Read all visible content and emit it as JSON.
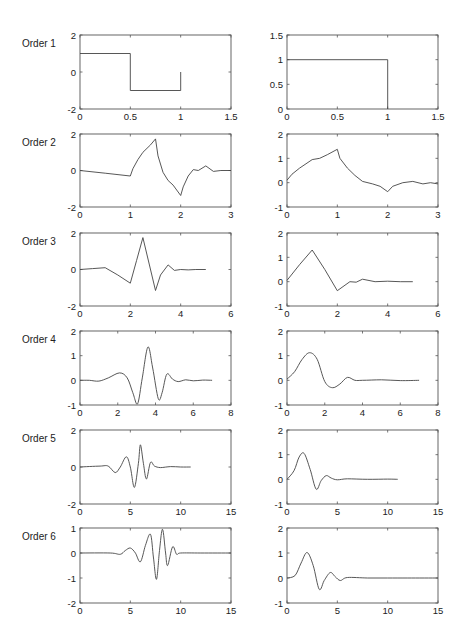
{
  "figure": {
    "width": 465,
    "height": 643,
    "layout": {
      "col_x": [
        [
          80,
          231
        ],
        [
          287,
          438
        ]
      ],
      "row_y": [
        [
          35,
          109
        ],
        [
          134,
          207
        ],
        [
          233,
          306
        ],
        [
          331,
          405
        ],
        [
          430,
          504
        ],
        [
          528,
          603
        ]
      ],
      "row_label_x": 22
    }
  },
  "chart_data": {
    "type": "line",
    "title": "",
    "grid": false,
    "rows": [
      {
        "label": "Order 1",
        "left": {
          "xlim": [
            0,
            1.5
          ],
          "ylim": [
            -2,
            2
          ],
          "xticks": [
            0,
            0.5,
            1,
            1.5
          ],
          "xtick_labels": [
            "0",
            "0.5",
            "1",
            "1.5"
          ],
          "yticks": [
            -2,
            0,
            2
          ],
          "ytick_labels": [
            "-2",
            "0",
            "2"
          ],
          "x": [
            0,
            0.5,
            0.5,
            1,
            1
          ],
          "y": [
            1,
            1,
            -1,
            -1,
            0
          ]
        },
        "right": {
          "xlim": [
            0,
            1.5
          ],
          "ylim": [
            0,
            1.5
          ],
          "xticks": [
            0,
            0.5,
            1,
            1.5
          ],
          "xtick_labels": [
            "0",
            "0.5",
            "1",
            "1.5"
          ],
          "yticks": [
            0,
            0.5,
            1,
            1.5
          ],
          "ytick_labels": [
            "0",
            "0.5",
            "1",
            "1.5"
          ],
          "x": [
            0,
            1,
            1
          ],
          "y": [
            1,
            1,
            0
          ]
        }
      },
      {
        "label": "Order 2",
        "left": {
          "xlim": [
            0,
            3
          ],
          "ylim": [
            -2,
            2
          ],
          "xticks": [
            0,
            1,
            2,
            3
          ],
          "xtick_labels": [
            "0",
            "1",
            "2",
            "3"
          ],
          "yticks": [
            -2,
            0,
            2
          ],
          "ytick_labels": [
            "-2",
            "0",
            "2"
          ],
          "x": [
            0,
            0.5,
            1,
            1.05,
            1.15,
            1.25,
            1.4,
            1.5,
            1.55,
            1.65,
            1.75,
            1.85,
            2,
            2.05,
            2.15,
            2.25,
            2.35,
            2.5,
            2.65,
            2.8,
            3
          ],
          "y": [
            0,
            -0.15,
            -0.3,
            0.1,
            0.6,
            1.0,
            1.4,
            1.73,
            0.8,
            -0.1,
            -0.55,
            -0.8,
            -1.37,
            -0.9,
            -0.3,
            0.05,
            0.0,
            0.25,
            -0.05,
            0.0,
            0.0
          ]
        },
        "right": {
          "xlim": [
            0,
            3
          ],
          "ylim": [
            -1,
            2
          ],
          "xticks": [
            0,
            1,
            2,
            3
          ],
          "xtick_labels": [
            "0",
            "1",
            "2",
            "3"
          ],
          "yticks": [
            -1,
            0,
            1,
            2
          ],
          "ytick_labels": [
            "-1",
            "0",
            "1",
            "2"
          ],
          "x": [
            0,
            0.1,
            0.25,
            0.5,
            0.65,
            0.8,
            1,
            1.05,
            1.2,
            1.35,
            1.5,
            1.7,
            1.85,
            2,
            2.1,
            2.3,
            2.5,
            2.7,
            2.85,
            3
          ],
          "y": [
            0.1,
            0.35,
            0.6,
            0.95,
            1.0,
            1.15,
            1.37,
            1.0,
            0.6,
            0.3,
            0.05,
            -0.05,
            -0.15,
            -0.37,
            -0.15,
            0.0,
            0.05,
            -0.05,
            0.0,
            -0.05
          ]
        }
      },
      {
        "label": "Order 3",
        "left": {
          "xlim": [
            0,
            6
          ],
          "ylim": [
            -2,
            2
          ],
          "xticks": [
            0,
            2,
            4,
            6
          ],
          "xtick_labels": [
            "0",
            "2",
            "4",
            "6"
          ],
          "yticks": [
            -2,
            0,
            2
          ],
          "ytick_labels": [
            "-2",
            "0",
            "2"
          ],
          "x": [
            0,
            0.5,
            1,
            1.5,
            2,
            2.25,
            2.5,
            2.75,
            3,
            3.2,
            3.5,
            3.75,
            4,
            4.3,
            4.6,
            5
          ],
          "y": [
            0,
            0.05,
            0.1,
            -0.3,
            -0.75,
            0.5,
            1.75,
            0.3,
            -1.15,
            -0.3,
            0.25,
            -0.05,
            0.0,
            -0.02,
            0.0,
            0.0
          ]
        },
        "right": {
          "xlim": [
            0,
            6
          ],
          "ylim": [
            -1,
            2
          ],
          "xticks": [
            0,
            2,
            4,
            6
          ],
          "xtick_labels": [
            "0",
            "2",
            "4",
            "6"
          ],
          "yticks": [
            -1,
            0,
            1,
            2
          ],
          "ytick_labels": [
            "-1",
            "0",
            "1",
            "2"
          ],
          "x": [
            0,
            0.5,
            1,
            1.5,
            2,
            2.5,
            2.75,
            3,
            3.5,
            4,
            4.5,
            5
          ],
          "y": [
            0.05,
            0.7,
            1.3,
            0.5,
            -0.37,
            0.0,
            -0.02,
            0.1,
            0.0,
            0.02,
            0.0,
            0.0
          ]
        }
      },
      {
        "label": "Order 4",
        "left": {
          "xlim": [
            0,
            8
          ],
          "ylim": [
            -1,
            2
          ],
          "xticks": [
            0,
            2,
            4,
            6,
            8
          ],
          "xtick_labels": [
            "0",
            "2",
            "4",
            "6",
            "8"
          ],
          "yticks": [
            -1,
            0,
            1,
            2
          ],
          "ytick_labels": [
            "-1",
            "0",
            "1",
            "2"
          ],
          "x": [
            0,
            0.5,
            1,
            1.5,
            2.1,
            2.5,
            2.8,
            3.05,
            3.3,
            3.6,
            3.85,
            4.15,
            4.35,
            4.6,
            4.9,
            5.2,
            5.6,
            6,
            6.5,
            7
          ],
          "y": [
            0,
            0,
            -0.03,
            0.1,
            0.3,
            0.1,
            -0.5,
            -0.95,
            0.1,
            1.35,
            0.5,
            -0.75,
            -0.5,
            0.25,
            0.05,
            -0.05,
            0.02,
            -0.02,
            0.01,
            0.0
          ]
        },
        "right": {
          "xlim": [
            0,
            8
          ],
          "ylim": [
            -1,
            2
          ],
          "xticks": [
            0,
            2,
            4,
            6,
            8
          ],
          "xtick_labels": [
            "0",
            "2",
            "4",
            "6",
            "8"
          ],
          "yticks": [
            -1,
            0,
            1,
            2
          ],
          "ytick_labels": [
            "-1",
            "0",
            "1",
            "2"
          ],
          "x": [
            0,
            0.4,
            0.8,
            1.2,
            1.6,
            2,
            2.4,
            2.8,
            3.2,
            3.6,
            4,
            5,
            6,
            7
          ],
          "y": [
            0.05,
            0.35,
            0.85,
            1.12,
            0.85,
            -0.05,
            -0.3,
            -0.15,
            0.12,
            0.0,
            0.0,
            0.02,
            -0.01,
            0.0
          ]
        }
      },
      {
        "label": "Order 5",
        "left": {
          "xlim": [
            0,
            15
          ],
          "ylim": [
            -2,
            2
          ],
          "xticks": [
            0,
            5,
            10,
            15
          ],
          "xtick_labels": [
            "0",
            "5",
            "10",
            "15"
          ],
          "yticks": [
            -2,
            0,
            2
          ],
          "ytick_labels": [
            "-2",
            "0",
            "2"
          ],
          "x": [
            0,
            2,
            2.8,
            3.5,
            4,
            4.6,
            5,
            5.4,
            5.8,
            6.0,
            6.3,
            6.6,
            7.0,
            7.4,
            8,
            9,
            10,
            11
          ],
          "y": [
            0,
            0.05,
            0.05,
            -0.3,
            0.0,
            0.55,
            0.0,
            -1.1,
            0.2,
            1.2,
            0.2,
            -0.65,
            0.25,
            0.05,
            -0.03,
            0.02,
            0.0,
            0.0
          ]
        },
        "right": {
          "xlim": [
            0,
            15
          ],
          "ylim": [
            -1,
            2
          ],
          "xticks": [
            0,
            5,
            10,
            15
          ],
          "xtick_labels": [
            "0",
            "5",
            "10",
            "15"
          ],
          "yticks": [
            -1,
            0,
            1,
            2
          ],
          "ytick_labels": [
            "-1",
            "0",
            "1",
            "2"
          ],
          "x": [
            0,
            0.7,
            1.2,
            1.7,
            2.3,
            2.9,
            3.4,
            3.9,
            4.4,
            5,
            6,
            8,
            10,
            11
          ],
          "y": [
            0.0,
            0.35,
            0.9,
            1.05,
            0.4,
            -0.4,
            -0.05,
            0.15,
            0.05,
            -0.02,
            0.02,
            0.0,
            0.01,
            0.0
          ]
        }
      },
      {
        "label": "Order 6",
        "left": {
          "xlim": [
            0,
            15
          ],
          "ylim": [
            -2,
            1
          ],
          "xticks": [
            0,
            5,
            10,
            15
          ],
          "xtick_labels": [
            "0",
            "5",
            "10",
            "15"
          ],
          "yticks": [
            -2,
            -1,
            0,
            1
          ],
          "ytick_labels": [
            "-2",
            "-1",
            "0",
            "1"
          ],
          "x": [
            0,
            3,
            4,
            4.5,
            5,
            5.5,
            6,
            6.5,
            7,
            7.3,
            7.6,
            7.9,
            8.2,
            8.5,
            8.7,
            9.2,
            9.6,
            10,
            12,
            15
          ],
          "y": [
            0,
            0,
            -0.05,
            0.1,
            0.2,
            0.0,
            -0.35,
            0.3,
            0.75,
            -0.2,
            -1.05,
            0.1,
            0.95,
            0.0,
            -0.5,
            0.25,
            -0.05,
            0.0,
            0.0,
            0.0
          ]
        },
        "right": {
          "xlim": [
            0,
            15
          ],
          "ylim": [
            -1,
            2
          ],
          "xticks": [
            0,
            5,
            10,
            15
          ],
          "xtick_labels": [
            "0",
            "5",
            "10",
            "15"
          ],
          "yticks": [
            -1,
            0,
            1,
            2
          ],
          "ytick_labels": [
            "-1",
            "0",
            "1",
            "2"
          ],
          "x": [
            0,
            0.8,
            1.4,
            2.0,
            2.6,
            3.2,
            3.7,
            4.3,
            4.8,
            5.3,
            6,
            8,
            10,
            12,
            15
          ],
          "y": [
            0.0,
            0.1,
            0.6,
            1.02,
            0.5,
            -0.45,
            -0.1,
            0.22,
            0.05,
            -0.1,
            0.02,
            0.0,
            0.0,
            0.0,
            0.0
          ]
        }
      }
    ]
  }
}
